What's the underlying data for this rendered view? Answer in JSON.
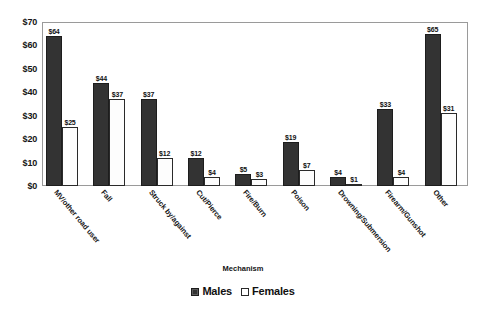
{
  "chart_data": {
    "type": "bar",
    "title": "",
    "xlabel": "Mechanism",
    "ylabel": "",
    "ylim": [
      0,
      70
    ],
    "ytick_step": 10,
    "ytick_prefix": "$",
    "grid": false,
    "legend_position": "bottom",
    "yticks": [
      "$70",
      "$60",
      "$50",
      "$40",
      "$30",
      "$20",
      "$10",
      "$0"
    ],
    "categories": [
      "MV/other road user",
      "Fall",
      "Struck by/against",
      "Cut/Pierce",
      "Fire/Burn",
      "Poison",
      "Drowning/Submersion",
      "Firearm/Gunshot",
      "Other"
    ],
    "series": [
      {
        "name": "Males",
        "color": "#333333",
        "values": [
          64,
          44,
          37,
          12,
          5,
          19,
          4,
          33,
          65
        ],
        "labels": [
          "$64",
          "$44",
          "$37",
          "$12",
          "$5",
          "$19",
          "$4",
          "$33",
          "$65"
        ]
      },
      {
        "name": "Females",
        "color": "#ffffff",
        "values": [
          25,
          37,
          12,
          4,
          3,
          7,
          1,
          4,
          31
        ],
        "labels": [
          "$25",
          "$37",
          "$12",
          "$4",
          "$3",
          "$7",
          "$1",
          "$4",
          "$31"
        ]
      }
    ]
  },
  "legend": {
    "items": [
      {
        "label": "Males",
        "swatch": "filled-square-icon"
      },
      {
        "label": "Females",
        "swatch": "open-square-icon"
      }
    ]
  },
  "axis": {
    "x_title": "Mechanism"
  }
}
